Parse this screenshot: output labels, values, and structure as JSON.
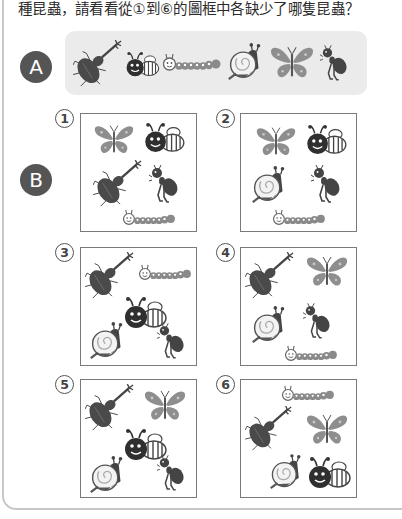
{
  "title": "種昆蟲，請看看從①到⑥的圖框中各缺少了哪隻昆蟲？",
  "section_a": {
    "label": "A",
    "insects": [
      "beetle",
      "bee",
      "caterpillar",
      "snail",
      "butterfly",
      "ant"
    ]
  },
  "section_b": {
    "label": "B",
    "frames": [
      {
        "number": "1",
        "insects": [
          "butterfly",
          "bee",
          "beetle",
          "ant",
          "caterpillar"
        ],
        "missing": "snail"
      },
      {
        "number": "2",
        "insects": [
          "butterfly",
          "bee",
          "snail",
          "ant",
          "caterpillar"
        ],
        "missing": "beetle"
      },
      {
        "number": "3",
        "insects": [
          "beetle",
          "caterpillar",
          "bee",
          "snail",
          "ant"
        ],
        "missing": "butterfly"
      },
      {
        "number": "4",
        "insects": [
          "beetle",
          "butterfly",
          "snail",
          "ant",
          "caterpillar"
        ],
        "missing": "bee"
      },
      {
        "number": "5",
        "insects": [
          "beetle",
          "butterfly",
          "bee",
          "snail",
          "ant"
        ],
        "missing": "caterpillar"
      },
      {
        "number": "6",
        "insects": [
          "caterpillar",
          "beetle",
          "butterfly",
          "snail",
          "bee"
        ],
        "missing": "ant"
      }
    ]
  },
  "colors": {
    "badge": "#555555",
    "panel": "#ebebeb",
    "butterfly": "#8e8e8e",
    "dark": "#3c3c3c"
  }
}
